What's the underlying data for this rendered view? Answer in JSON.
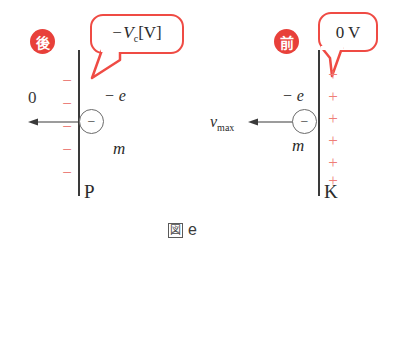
{
  "figure": {
    "caption_glyph": "図",
    "caption_text": "e"
  },
  "left_side": {
    "badge_label": "後",
    "badge_color": "#e8403a",
    "bubble": {
      "sign": "−",
      "symbol": "V",
      "subscript": "c",
      "unit": "[V]"
    },
    "plate_label": "P",
    "potential_label": "0",
    "charge_symbol": "−",
    "charge_count": 5,
    "charge_color": "#e8645e",
    "electron": {
      "glyph": "−",
      "charge_label": "− e",
      "mass_label": "m"
    },
    "arrow_direction": "left"
  },
  "right_side": {
    "badge_label": "前",
    "badge_color": "#e8403a",
    "bubble": {
      "text": "0 V"
    },
    "plate_label": "K",
    "charge_symbol": "+",
    "charge_count": 6,
    "charge_color": "#ef7e78",
    "electron": {
      "glyph": "−",
      "charge_label": "− e",
      "mass_label": "m"
    },
    "velocity_symbol": "v",
    "velocity_subscript": "max",
    "arrow_direction": "left"
  }
}
